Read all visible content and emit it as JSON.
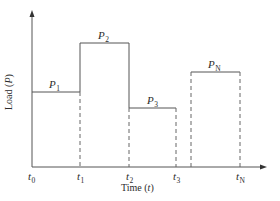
{
  "diagram": {
    "type": "step-load-profile",
    "axes": {
      "y_label_text": "Load (",
      "y_label_var": "P",
      "y_label_close": ")",
      "x_label_text": "Time (",
      "x_label_var": "t",
      "x_label_close": ")"
    },
    "colors": {
      "line": "#555555",
      "text": "#2b2b2b",
      "background": "#ffffff"
    },
    "time_ticks": [
      {
        "base": "t",
        "sub": "0"
      },
      {
        "base": "t",
        "sub": "1"
      },
      {
        "base": "t",
        "sub": "2"
      },
      {
        "base": "t",
        "sub": "3"
      },
      {
        "base": "t",
        "sub": "N"
      }
    ],
    "loads": [
      {
        "base": "P",
        "sub": "1"
      },
      {
        "base": "P",
        "sub": "2"
      },
      {
        "base": "P",
        "sub": "3"
      },
      {
        "base": "P",
        "sub": "N"
      }
    ]
  }
}
